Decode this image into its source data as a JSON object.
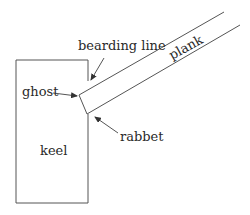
{
  "diagram": {
    "labels": {
      "bearding_line": "bearding line",
      "plank": "plank",
      "ghost": "ghost",
      "rabbet": "rabbet",
      "keel": "keel"
    },
    "colors": {
      "line": "#555555",
      "text": "#2a2a2a",
      "background": "#ffffff"
    }
  }
}
